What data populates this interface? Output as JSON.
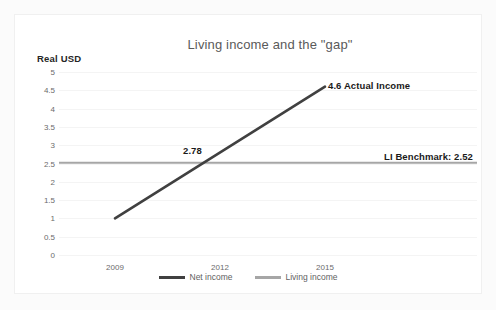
{
  "chart_data": {
    "type": "line",
    "title": "Living income and the \"gap\"",
    "xlabel": "",
    "ylabel": "Real USD",
    "ylim": [
      0,
      5
    ],
    "ytick_step": 0.5,
    "yticks": [
      "5",
      "4.5",
      "4",
      "3.5",
      "3",
      "2.5",
      "2",
      "1.5",
      "1",
      "0.5",
      "0"
    ],
    "categories": [
      "2009",
      "2012",
      "2015"
    ],
    "grid": true,
    "legend_position": "bottom",
    "series": [
      {
        "name": "Net income",
        "color": "#404040",
        "x": [
          "2009",
          "2015"
        ],
        "values": [
          1.0,
          4.6
        ]
      },
      {
        "name": "Living income",
        "color": "#a6a6a6",
        "x": [
          "2009",
          "2015"
        ],
        "values": [
          2.52,
          2.52
        ]
      }
    ],
    "annotations": [
      {
        "text": "2.78",
        "value": 2.78
      },
      {
        "text": "4.6 Actual Income",
        "value": 4.6
      },
      {
        "text": "LI Benchmark: 2.52",
        "value": 2.52
      }
    ],
    "colors": {
      "net_income": "#404040",
      "living_income": "#a6a6a6",
      "title": "#5a5a5a",
      "tick": "#6b6b6b",
      "gridline": "#f4f4f4",
      "annotation": "#1a1a1a"
    }
  },
  "legend": {
    "items": [
      {
        "label": "Net income",
        "color": "#404040"
      },
      {
        "label": "Living income",
        "color": "#a6a6a6"
      }
    ]
  },
  "axis": {
    "y_label": "Real USD",
    "y_ticks": [
      "5",
      "4.5",
      "4",
      "3.5",
      "3",
      "2.5",
      "2",
      "1.5",
      "1",
      "0.5",
      "0"
    ],
    "x_ticks": [
      "2009",
      "2012",
      "2015"
    ]
  },
  "annotations": {
    "crossing": "2.78",
    "actual_income": "4.6 Actual Income",
    "benchmark": "LI Benchmark: 2.52"
  },
  "title": "Living income and the \"gap\""
}
